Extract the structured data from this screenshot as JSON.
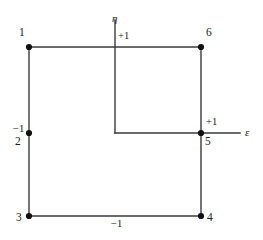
{
  "figure": {
    "type": "reference-element-diagram",
    "background_color": "#ffffff",
    "line_color": "#3a3a3a",
    "node_color": "#111111",
    "axes": {
      "horizontal": {
        "name": "ε",
        "label_x": 245,
        "label_y": 127
      },
      "vertical": {
        "name": "η",
        "label_x": 112,
        "label_y": 13
      }
    },
    "ticks": [
      {
        "id": "tick-eta-plus1",
        "text": "+1",
        "x": 118,
        "y": 31
      },
      {
        "id": "tick-eps-plus1",
        "text": "+1",
        "x": 206,
        "y": 117
      },
      {
        "id": "tick-eta-minus1",
        "text": "−1",
        "x": 13,
        "y": 124
      },
      {
        "id": "tick-eps-minus1",
        "text": "−1",
        "x": 111,
        "y": 219
      }
    ],
    "nodes": [
      {
        "id": "node-1",
        "label": "1",
        "cx": 29,
        "cy": 47,
        "label_x": 19,
        "label_y": 27
      },
      {
        "id": "node-2",
        "label": "2",
        "cx": 29,
        "cy": 133,
        "label_x": 15,
        "label_y": 136
      },
      {
        "id": "node-3",
        "label": "3",
        "cx": 29,
        "cy": 216,
        "label_x": 16,
        "label_y": 212
      },
      {
        "id": "node-4",
        "label": "4",
        "cx": 201,
        "cy": 216,
        "label_x": 207,
        "label_y": 212
      },
      {
        "id": "node-5",
        "label": "5",
        "cx": 201,
        "cy": 133,
        "label_x": 205,
        "label_y": 136
      },
      {
        "id": "node-6",
        "label": "6",
        "cx": 201,
        "cy": 47,
        "label_x": 206,
        "label_y": 27
      }
    ]
  }
}
